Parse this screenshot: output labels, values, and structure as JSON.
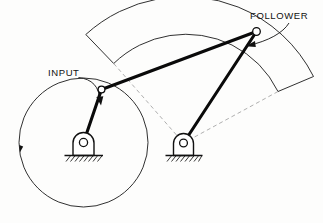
{
  "diagram": {
    "background_color": "#fdfdfc",
    "line_color": "#111111",
    "link_color": "#0a0a0a",
    "dashed_color": "#9a9a9a",
    "labels": {
      "input": "INPUT",
      "follower": "FOLLOWER"
    },
    "label_positions": {
      "input": {
        "x": 48,
        "y": 73
      },
      "follower": {
        "x": 250,
        "y": 16
      }
    },
    "joints": {
      "crank_pin": {
        "x": 101.5,
        "y": 89.5,
        "r": 3.4,
        "name": "crank-pin-joint"
      },
      "follower_pin": {
        "x": 256.5,
        "y": 31.5,
        "r": 3.8,
        "name": "follower-pin-joint"
      },
      "left_ground": {
        "x": 83.5,
        "y": 142.5,
        "r": 3.6,
        "name": "left-ground-pivot"
      },
      "right_ground": {
        "x": 183.5,
        "y": 143.0,
        "r": 3.4,
        "name": "right-ground-pivot"
      }
    },
    "links": [
      {
        "name": "crank-link",
        "from": "left_ground",
        "to": "crank_pin"
      },
      {
        "name": "coupler-link",
        "from": "crank_pin",
        "to": "follower_pin"
      },
      {
        "name": "follower-link",
        "from": "follower_pin",
        "to": "right_ground"
      }
    ],
    "crank_circle": {
      "name": "crank-rotation-path",
      "cx": 83.5,
      "cy": 142.5,
      "r": 64.5,
      "style": "solid",
      "direction": "counterclockwise"
    },
    "rotation_arrow": {
      "x": 19.5,
      "y": 150,
      "name": "rotation-direction-arrow"
    },
    "follower_sector": {
      "name": "follower-swing-sector",
      "center_x": 183.5,
      "center_y": 143.0,
      "outer_radius": 146,
      "inner_radius": 104,
      "start_angle_deg": 228,
      "end_angle_deg": 292,
      "outer_style": "solid",
      "radial_style": "dashed"
    }
  }
}
